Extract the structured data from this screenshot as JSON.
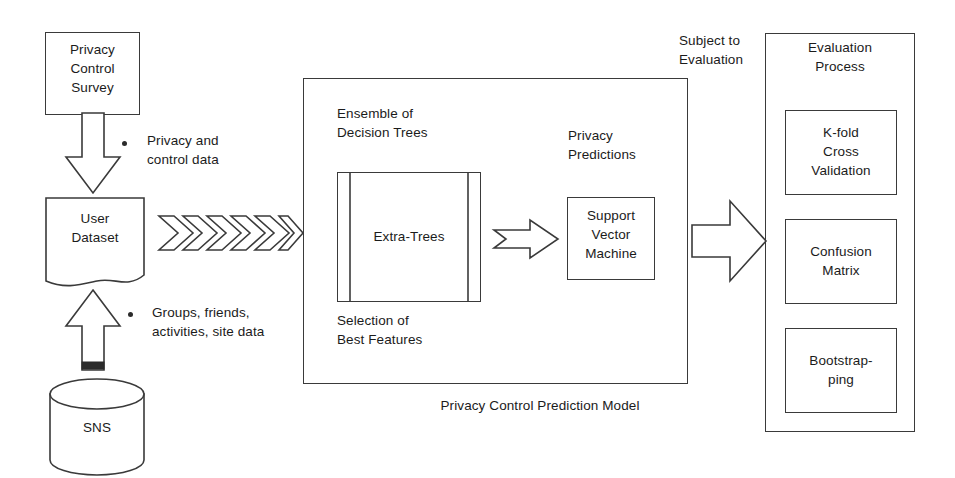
{
  "diagram": {
    "title": "Privacy Control Prediction Model",
    "ink_color": "#3a3a3a",
    "text_color": "#1b1b1b",
    "background": "#ffffff"
  },
  "inputs": {
    "survey_box": "Privacy\nControl\nSurvey",
    "survey_bullet": "Privacy and\ncontrol data",
    "dataset_doc": "User\nDataset",
    "dataset_bullet": "Groups, friends,\nactivities, site data",
    "source_cylinder": "SNS"
  },
  "model": {
    "caption": "Privacy Control Prediction Model",
    "ensemble_label": "Ensemble of\nDecision Trees",
    "extra_trees_label": "Extra-Trees",
    "selection_label": "Selection of\nBest Features",
    "predictions_label": "Privacy\nPredictions",
    "svm_label": "Support\nVector\nMachine"
  },
  "evaluation": {
    "connector_label": "Subject to\nEvaluation",
    "panel_title": "Evaluation\nProcess",
    "steps": [
      {
        "label": "K-fold\nCross\nValidation"
      },
      {
        "label": "Confusion\nMatrix"
      },
      {
        "label": "Bootstrap-\nping"
      }
    ]
  },
  "flow": {
    "chevron_count": 6,
    "chevron_name": "data-flow-chevrons",
    "arrow_survey_to_dataset": "down-block-arrow",
    "arrow_sns_to_dataset": "up-block-arrow",
    "arrow_trees_to_svm": "right-block-arrow-small",
    "arrow_model_to_evaluation": "right-block-arrow-large"
  }
}
